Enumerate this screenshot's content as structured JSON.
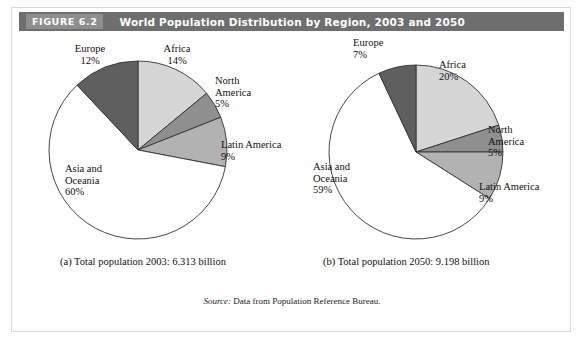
{
  "figure": {
    "tag": "FIGURE 6.2",
    "title": "World Population Distribution by Region, 2003 and 2050",
    "source_word": "Source:",
    "source_text": " Data from Population Reference Bureau."
  },
  "colors": {
    "header_bar": "#6e6e6e",
    "tag_box": "#8e8e8e",
    "africa": "#d6d6d6",
    "north_america": "#8f8f8f",
    "latin_america": "#b2b2b2",
    "asia_oceania": "#ffffff",
    "europe": "#5f5f5f",
    "outline": "#333333"
  },
  "chart_data": [
    {
      "type": "pie",
      "id": "pie-2003",
      "title": "(a) Total population 2003: 6.313 billion",
      "caption": "(a) Total population 2003: 6.313 billion",
      "categories": [
        "Africa",
        "North America",
        "Latin America",
        "Asia and Oceania",
        "Europe"
      ],
      "values": [
        14,
        5,
        9,
        60,
        12
      ],
      "labels": [
        "14%",
        "5%",
        "9%",
        "60%",
        "12%"
      ],
      "colors": [
        "#d6d6d6",
        "#8f8f8f",
        "#b2b2b2",
        "#ffffff",
        "#5f5f5f"
      ],
      "start_angle_deg": 0,
      "direction": "clockwise",
      "total_population": "6.313 billion",
      "year": "2003",
      "legend": "none",
      "slices": [
        {
          "name": "Africa",
          "percent": 14,
          "label": "Africa",
          "pct_text": "14%"
        },
        {
          "name": "North America",
          "percent": 5,
          "label": "North\nAmerica",
          "pct_text": "5%"
        },
        {
          "name": "Latin America",
          "percent": 9,
          "label": "Latin America",
          "pct_text": "9%"
        },
        {
          "name": "Asia and Oceania",
          "percent": 60,
          "label": "Asia and\nOceania",
          "pct_text": "60%"
        },
        {
          "name": "Europe",
          "percent": 12,
          "label": "Europe",
          "pct_text": "12%"
        }
      ]
    },
    {
      "type": "pie",
      "id": "pie-2050",
      "title": "(b) Total population 2050: 9.198 billion",
      "caption": "(b) Total population 2050: 9.198 billion",
      "categories": [
        "Africa",
        "North America",
        "Latin America",
        "Asia and Oceania",
        "Europe"
      ],
      "values": [
        20,
        5,
        9,
        59,
        7
      ],
      "labels": [
        "20%",
        "5%",
        "9%",
        "59%",
        "7%"
      ],
      "colors": [
        "#d6d6d6",
        "#8f8f8f",
        "#b2b2b2",
        "#ffffff",
        "#5f5f5f"
      ],
      "start_angle_deg": 0,
      "direction": "clockwise",
      "total_population": "9.198 billion",
      "year": "2050",
      "legend": "none",
      "slices": [
        {
          "name": "Africa",
          "percent": 20,
          "label": "Africa",
          "pct_text": "20%"
        },
        {
          "name": "North America",
          "percent": 5,
          "label": "North\nAmerica",
          "pct_text": "5%"
        },
        {
          "name": "Latin America",
          "percent": 9,
          "label": "Latin America",
          "pct_text": "9%"
        },
        {
          "name": "Asia and Oceania",
          "percent": 59,
          "label": "Asia and\nOceania",
          "pct_text": "59%"
        },
        {
          "name": "Europe",
          "percent": 7,
          "label": "Europe",
          "pct_text": "7%"
        }
      ]
    }
  ],
  "panel_a": {
    "caption": "(a) Total population 2003: 6.313 billion",
    "labels": {
      "europe_name": "Europe",
      "europe_pct": "12%",
      "africa_name": "Africa",
      "africa_pct": "14%",
      "north_america_name1": "North",
      "north_america_name2": "America",
      "north_america_pct": "5%",
      "latin_america_name": "Latin America",
      "latin_america_pct": "9%",
      "asia_name1": "Asia and",
      "asia_name2": "Oceania",
      "asia_pct": "60%"
    }
  },
  "panel_b": {
    "caption": "(b) Total population 2050: 9.198 billion",
    "labels": {
      "europe_name": "Europe",
      "europe_pct": "7%",
      "africa_name": "Africa",
      "africa_pct": "20%",
      "north_america_name1": "North",
      "north_america_name2": "America",
      "north_america_pct": "5%",
      "latin_america_name": "Latin America",
      "latin_america_pct": "9%",
      "asia_name1": "Asia and",
      "asia_name2": "Oceania",
      "asia_pct": "59%"
    }
  }
}
